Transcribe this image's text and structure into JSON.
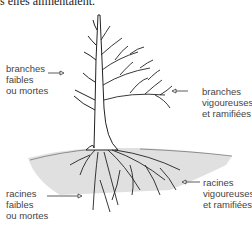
{
  "intro_text": "s elles alimentaient.",
  "labels": {
    "weak_branches": [
      "branches",
      "faibles",
      "ou mortes"
    ],
    "vigorous_branches": [
      "branches",
      "vigoureuses",
      "et ramifiées"
    ],
    "weak_roots": [
      "racines",
      "faibles",
      "ou mortes"
    ],
    "vigorous_roots": [
      "racines",
      "vigoureuses",
      "et ramifiées"
    ]
  }
}
